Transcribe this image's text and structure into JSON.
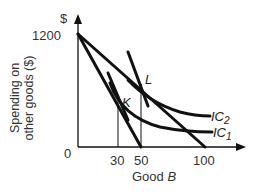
{
  "chart_data": {
    "type": "line",
    "title": "",
    "xlabel": "Good B",
    "ylabel_line1": "Spending on",
    "ylabel_line2": "other goods ($)",
    "y_axis_unit": "$",
    "x_ticks": [
      "0",
      "30",
      "50",
      "100"
    ],
    "y_ticks": [
      "1200"
    ],
    "origin_label": "0",
    "xlim": [
      0,
      110
    ],
    "ylim": [
      0,
      1300
    ],
    "grid": false,
    "series": [
      {
        "name": "Budget line 1",
        "x": [
          0,
          50
        ],
        "y": [
          1200,
          0
        ]
      },
      {
        "name": "Budget line 2",
        "x": [
          0,
          100
        ],
        "y": [
          1200,
          0
        ]
      },
      {
        "name": "IC1",
        "label_main": "IC",
        "label_sub": "1",
        "tangent_point": "K",
        "tangent_x": 30,
        "tangent_y": 480
      },
      {
        "name": "IC2",
        "label_main": "IC",
        "label_sub": "2",
        "tangent_point": "L",
        "tangent_x": 50,
        "tangent_y": 600
      }
    ],
    "annotations": [
      {
        "text": "K",
        "x": 30,
        "y": 480
      },
      {
        "text": "L",
        "x": 50,
        "y": 600
      }
    ],
    "drop_lines": [
      30,
      50
    ]
  }
}
